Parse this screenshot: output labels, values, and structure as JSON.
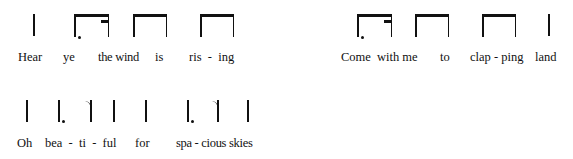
{
  "rhythm_lines": [
    {
      "id": "line-1a",
      "notation": [
        "quarter",
        "dotted-eighth-sixteenth",
        "two-eighths",
        "two-eighths"
      ],
      "lyrics": [
        "Hear",
        "ye",
        "the wind",
        "is",
        "ris  -  ing"
      ]
    },
    {
      "id": "line-1b",
      "notation": [
        "dotted-eighth-sixteenth",
        "two-eighths",
        "two-eighths",
        "quarter"
      ],
      "lyrics": [
        "Come",
        "with me",
        "to",
        "clap - ping",
        "land"
      ]
    },
    {
      "id": "line-2",
      "notation": [
        "quarter",
        "dotted-quarter",
        "eighth",
        "quarter",
        "quarter",
        "dotted-quarter",
        "eighth",
        "quarter"
      ],
      "lyrics": [
        "Oh",
        "bea  -  ti  -  ful",
        "for",
        "spa - cious skies"
      ]
    }
  ],
  "colors": {
    "ink": "#111111",
    "background": "#ffffff"
  }
}
